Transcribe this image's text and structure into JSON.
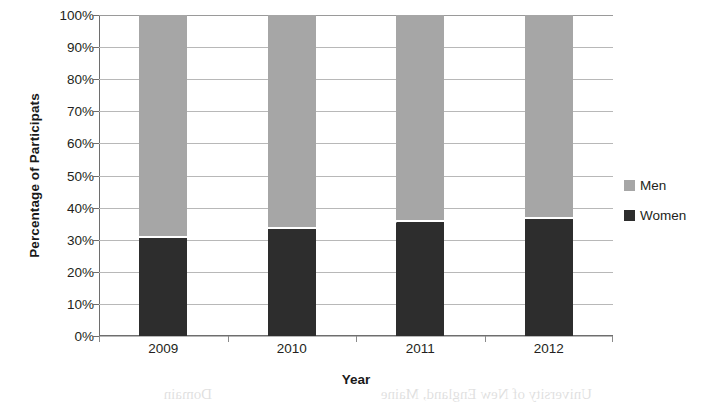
{
  "chart_data": {
    "type": "bar",
    "subtype": "stacked-bar-100-percent",
    "title": "",
    "xlabel": "Year",
    "ylabel": "Percentage of Participats",
    "categories": [
      "2009",
      "2010",
      "2011",
      "2012"
    ],
    "series": [
      {
        "name": "Women",
        "values": [
          31,
          34,
          36,
          37
        ],
        "color": "#2d2d2d"
      },
      {
        "name": "Men",
        "values": [
          69,
          66,
          64,
          63
        ],
        "color": "#a6a6a6"
      }
    ],
    "stack_order_bottom_to_top": [
      "Women",
      "Men"
    ],
    "ylim": [
      0,
      100
    ],
    "yticks": [
      "0%",
      "10%",
      "20%",
      "30%",
      "40%",
      "50%",
      "60%",
      "70%",
      "80%",
      "90%",
      "100%"
    ],
    "ytick_values": [
      0,
      10,
      20,
      30,
      40,
      50,
      60,
      70,
      80,
      90,
      100
    ],
    "grid": "horizontal",
    "legend_position": "right",
    "legend_entries": [
      "Men",
      "Women"
    ],
    "series_lines": true,
    "series_line_color": "#ffffff"
  },
  "legend": {
    "items": [
      {
        "label": "Men",
        "color": "#a6a6a6"
      },
      {
        "label": "Women",
        "color": "#2d2d2d"
      }
    ]
  },
  "axis": {
    "x_title": "Year",
    "y_title": "Percentage of Participats"
  },
  "artifact": {
    "bleed_text_left": "Domain",
    "bleed_text_center": "University of New England, Maine"
  }
}
